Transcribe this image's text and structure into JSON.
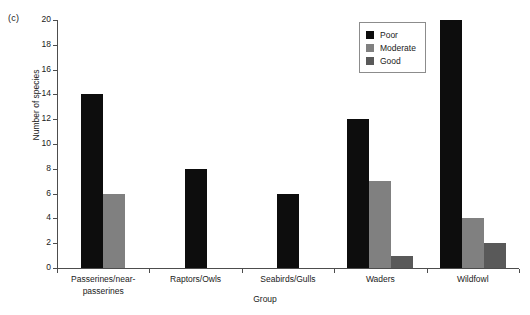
{
  "panel": {
    "label": "(c)"
  },
  "legend": {
    "position": "top-right",
    "entries": [
      {
        "label": "Poor",
        "color": "#0d0d0d"
      },
      {
        "label": "Moderate",
        "color": "#808080"
      },
      {
        "label": "Good",
        "color": "#595959"
      }
    ]
  },
  "chart_data": {
    "type": "bar",
    "title": "",
    "subtitle": "",
    "xlabel": "Group",
    "ylabel": "Number of species",
    "categories": [
      "Passerines/near-passerines",
      "Raptors/Owls",
      "Seabirds/Gulls",
      "Waders",
      "Wildfowl"
    ],
    "category_lines": [
      [
        "Passerines/near-",
        "passerines"
      ],
      [
        "Raptors/Owls"
      ],
      [
        "Seabirds/Gulls"
      ],
      [
        "Waders"
      ],
      [
        "Wildfowl"
      ]
    ],
    "series": [
      {
        "name": "Poor",
        "color": "#0d0d0d",
        "values": [
          14,
          8,
          6,
          12,
          20
        ]
      },
      {
        "name": "Moderate",
        "color": "#808080",
        "values": [
          6,
          0,
          0,
          7,
          4
        ]
      },
      {
        "name": "Good",
        "color": "#595959",
        "values": [
          0,
          0,
          0,
          1,
          2
        ]
      }
    ],
    "ylim": [
      0,
      20
    ],
    "ytick_values": [
      0,
      2,
      4,
      6,
      8,
      10,
      12,
      14,
      16,
      18,
      20
    ],
    "ytick_labels": [
      "0",
      "2",
      "4",
      "6",
      "8",
      "10",
      "12",
      "14",
      "16",
      "18",
      "20"
    ],
    "grid": false,
    "legend_position": "top-right"
  }
}
